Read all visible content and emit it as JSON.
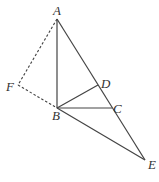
{
  "figure": {
    "points": {
      "A": "A",
      "B": "B",
      "C": "C",
      "D": "D",
      "E": "E",
      "F": "F"
    },
    "solid_segments": [
      "AB",
      "AE",
      "BC",
      "BD",
      "BE"
    ],
    "dashed_segments": [
      "AF",
      "FB"
    ]
  }
}
